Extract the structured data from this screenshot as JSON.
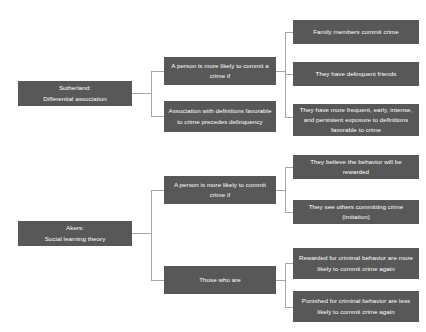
{
  "diagram": {
    "type": "hierarchy-tree",
    "colors": {
      "node_fill": "#585858",
      "node_text": "#ffffff",
      "connector": "#a6a6a6",
      "background": "#ffffff"
    },
    "branches": [
      {
        "id": "sutherland",
        "root": {
          "line1": "Sutherland:",
          "line2": "Differential association"
        },
        "children": [
          {
            "id": "sutherland-condition",
            "label": "A person is more likely to commit a crime if",
            "children": [
              {
                "id": "family-members",
                "label": "Family members commit crime"
              },
              {
                "id": "delinquent-friends",
                "label": "They have delinquent friends"
              },
              {
                "id": "frequent-exposure",
                "label": "They have more frequent, early, intense, and persistent exposure to definitions favorable to crime"
              }
            ]
          },
          {
            "id": "association-definitions",
            "label": "Association with definitions favorable to crime precedes delinquency",
            "children": []
          }
        ]
      },
      {
        "id": "akers",
        "root": {
          "line1": "Akers:",
          "line2": "Social learning theory"
        },
        "children": [
          {
            "id": "akers-condition",
            "label": "A person is more likely to commit crime if",
            "children": [
              {
                "id": "believe-rewarded",
                "label": "They believe the behavior will be rewarded"
              },
              {
                "id": "see-others",
                "label": "They see others committing crime (imitation)"
              }
            ]
          },
          {
            "id": "those-who-are",
            "label": "Those who are",
            "children": [
              {
                "id": "rewarded-more-likely",
                "label": "Rewarded for criminal behavior are more likely to commit crime again"
              },
              {
                "id": "punished-less-likely",
                "label": "Punished for criminal behavior are less likely to commit crime again"
              }
            ]
          }
        ]
      }
    ]
  }
}
